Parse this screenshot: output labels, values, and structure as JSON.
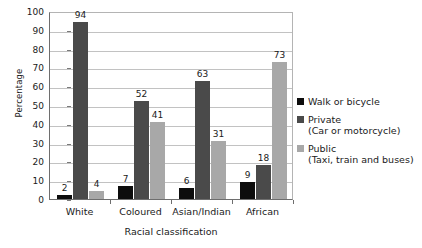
{
  "chart_data": {
    "type": "bar",
    "title": "",
    "xlabel": "Racial classification",
    "ylabel": "Percentage",
    "ylim": [
      0,
      100
    ],
    "ytick_step": 10,
    "yticks": [
      0,
      10,
      20,
      30,
      40,
      50,
      60,
      70,
      80,
      90,
      100
    ],
    "grid": true,
    "legend_position": "right",
    "categories": [
      "White",
      "Coloured",
      "Asian/Indian",
      "African"
    ],
    "series": [
      {
        "name": "Walk or bicycle",
        "sublabel": "",
        "color": "#0d0d0d",
        "values": [
          2,
          7,
          6,
          9
        ]
      },
      {
        "name": "Private",
        "sublabel": "(Car or motorcycle)",
        "color": "#4a4a4a",
        "values": [
          94,
          52,
          63,
          18
        ]
      },
      {
        "name": "Public",
        "sublabel": "(Taxi, train and buses)",
        "color": "#a8a8a8",
        "values": [
          4,
          41,
          31,
          73
        ]
      }
    ]
  }
}
